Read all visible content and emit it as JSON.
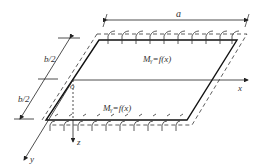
{
  "diagram": {
    "labels": {
      "a": "a",
      "b_half_top": "b/2",
      "b_half_bottom": "b/2",
      "origin": "o",
      "x_axis": "x",
      "y_axis": "y",
      "z_axis": "z",
      "moment_top": "Mᵧ=f(x)",
      "moment_bottom": "Mᵧ=f(x)"
    },
    "colors": {
      "line": "#222222",
      "background": "#ffffff"
    }
  }
}
